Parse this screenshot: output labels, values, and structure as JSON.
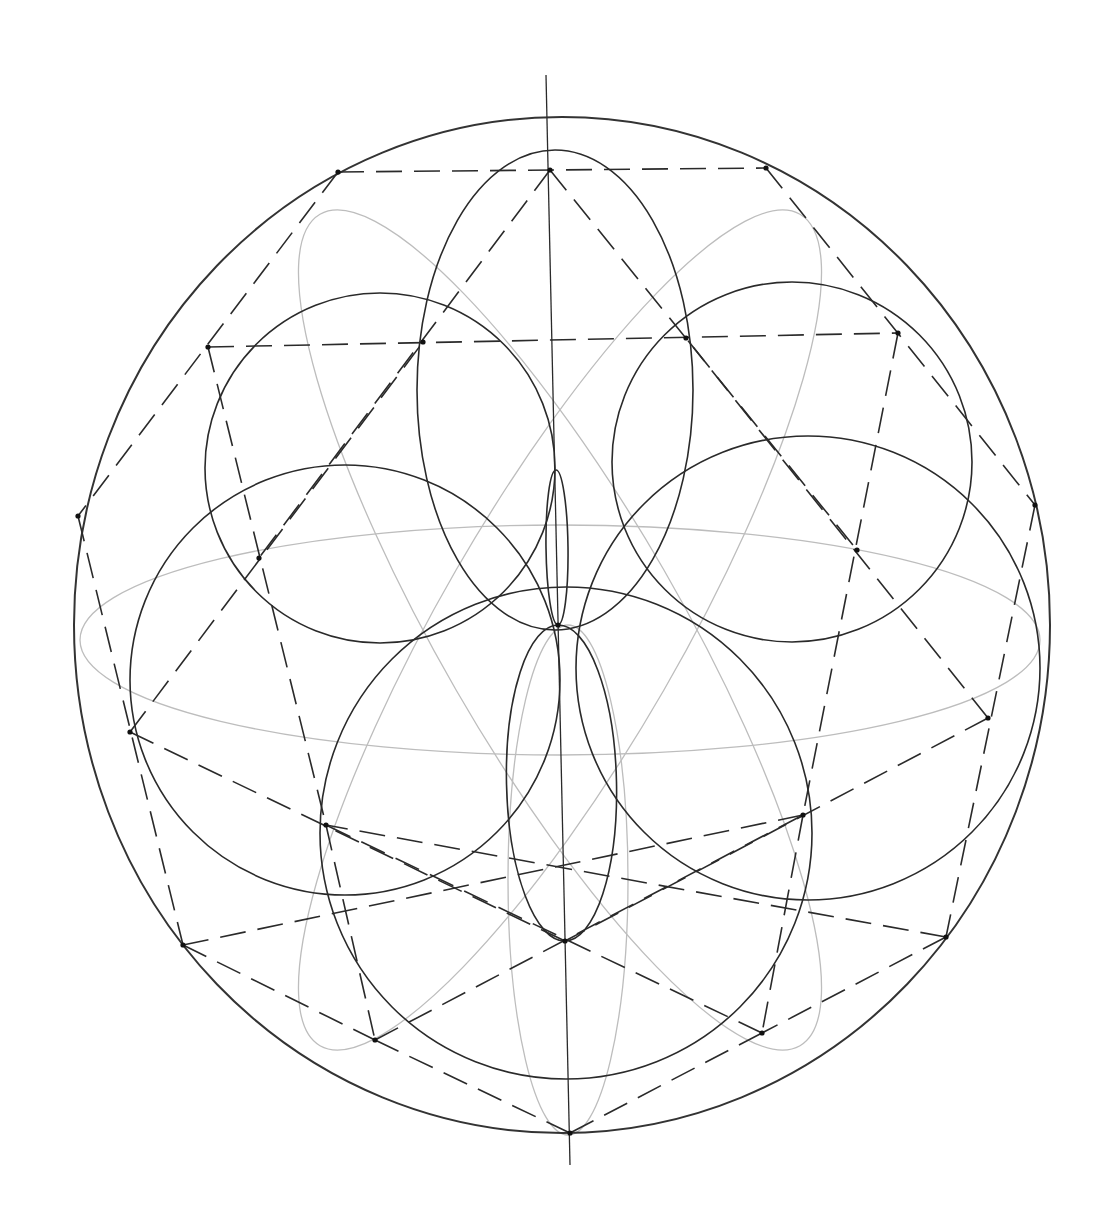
{
  "drawing": {
    "title": "Pencil construction: Seed-of-life rosette with hexagram",
    "center": [
      558,
      625
    ],
    "outer_circle": {
      "cx": 562,
      "cy": 625,
      "rx": 488,
      "ry": 508
    },
    "vertical_axis": {
      "x1": 546,
      "y1": 75,
      "x2": 570,
      "y2": 1165
    },
    "dark_circles": [
      {
        "cx": 555,
        "cy": 390,
        "r": 138,
        "ry": 240
      },
      {
        "cx": 380,
        "cy": 468,
        "r": 175
      },
      {
        "cx": 792,
        "cy": 462,
        "r": 180
      },
      {
        "cx": 345,
        "cy": 680,
        "r": 215
      },
      {
        "cx": 808,
        "cy": 668,
        "r": 232
      },
      {
        "cx": 566,
        "cy": 833,
        "r": 246
      }
    ],
    "lenses": [
      {
        "x1": 558,
        "y1": 625,
        "x2": 556,
        "y2": 470,
        "w": 22
      },
      {
        "x1": 558,
        "y1": 625,
        "x2": 565,
        "y2": 941,
        "w": 110
      }
    ],
    "light_arcs": [
      {
        "cx": 560,
        "cy": 640,
        "rx": 480,
        "ry": 115,
        "rot": 0
      },
      {
        "cx": 560,
        "cy": 630,
        "rx": 480,
        "ry": 120,
        "rot": 60
      },
      {
        "cx": 560,
        "cy": 630,
        "rx": 480,
        "ry": 120,
        "rot": -60
      },
      {
        "cx": 568,
        "cy": 880,
        "rx": 60,
        "ry": 255,
        "rot": 0
      }
    ],
    "outer_vertices": [
      [
        550,
        170
      ],
      [
        766,
        168
      ],
      [
        898,
        333
      ],
      [
        1035,
        505
      ],
      [
        988,
        718
      ],
      [
        946,
        937
      ],
      [
        762,
        1033
      ],
      [
        570,
        1133
      ],
      [
        375,
        1040
      ],
      [
        183,
        945
      ],
      [
        130,
        732
      ],
      [
        78,
        516
      ],
      [
        208,
        347
      ],
      [
        338,
        172
      ]
    ],
    "inner_vertices": [
      [
        423,
        342
      ],
      [
        686,
        338
      ],
      [
        857,
        550
      ],
      [
        803,
        815
      ],
      [
        565,
        941
      ],
      [
        326,
        825
      ],
      [
        259,
        558
      ]
    ],
    "dashed_lines": [
      [
        [
          338,
          172
        ],
        [
          766,
          168
        ]
      ],
      [
        [
          208,
          347
        ],
        [
          898,
          333
        ]
      ],
      [
        [
          338,
          172
        ],
        [
          78,
          516
        ]
      ],
      [
        [
          766,
          168
        ],
        [
          1035,
          505
        ]
      ],
      [
        [
          550,
          170
        ],
        [
          259,
          558
        ]
      ],
      [
        [
          550,
          170
        ],
        [
          857,
          550
        ]
      ],
      [
        [
          208,
          347
        ],
        [
          326,
          825
        ]
      ],
      [
        [
          898,
          333
        ],
        [
          803,
          815
        ]
      ],
      [
        [
          78,
          516
        ],
        [
          183,
          945
        ]
      ],
      [
        [
          1035,
          505
        ],
        [
          946,
          937
        ]
      ],
      [
        [
          130,
          732
        ],
        [
          565,
          941
        ]
      ],
      [
        [
          988,
          718
        ],
        [
          565,
          941
        ]
      ],
      [
        [
          130,
          732
        ],
        [
          423,
          342
        ]
      ],
      [
        [
          988,
          718
        ],
        [
          686,
          338
        ]
      ],
      [
        [
          183,
          945
        ],
        [
          375,
          1040
        ]
      ],
      [
        [
          946,
          937
        ],
        [
          762,
          1033
        ]
      ],
      [
        [
          375,
          1040
        ],
        [
          570,
          1133
        ]
      ],
      [
        [
          762,
          1033
        ],
        [
          570,
          1133
        ]
      ],
      [
        [
          183,
          945
        ],
        [
          803,
          815
        ]
      ],
      [
        [
          946,
          937
        ],
        [
          326,
          825
        ]
      ],
      [
        [
          375,
          1040
        ],
        [
          803,
          815
        ]
      ],
      [
        [
          762,
          1033
        ],
        [
          326,
          825
        ]
      ],
      [
        [
          326,
          825
        ],
        [
          375,
          1040
        ]
      ],
      [
        [
          803,
          815
        ],
        [
          762,
          1033
        ]
      ]
    ],
    "colors": {
      "ink": "#2a2a2a",
      "light_pencil": "#bdbdbd",
      "paper": "#ffffff"
    }
  }
}
